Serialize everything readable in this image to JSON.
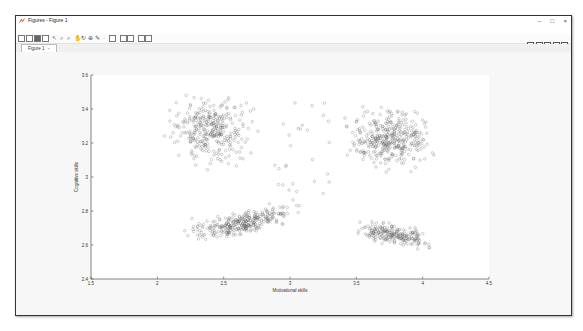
{
  "window": {
    "title": "Figures - Figure 1",
    "controls": {
      "minimize": "–",
      "maximize": "□",
      "close": "×"
    }
  },
  "menubar": {
    "items": [
      "File",
      "Edit",
      "View",
      "Insert",
      "Tools",
      "Debug",
      "Desktop",
      "Window",
      "Help"
    ]
  },
  "toolbar": {
    "buttons": [
      "new-figure",
      "open",
      "save",
      "print",
      "pointer",
      "zoom-in",
      "zoom-out",
      "pan",
      "rotate",
      "data-cursor",
      "brush",
      "link",
      "colorbar",
      "legend",
      "grid",
      "property-editor"
    ],
    "dock_buttons": [
      "tile",
      "left-right",
      "top-bottom",
      "float",
      "maximize"
    ]
  },
  "tabs": [
    {
      "label": "Figure 1",
      "close": "×"
    }
  ],
  "chart_data": {
    "type": "scatter",
    "title": "",
    "xlabel": "Motivational skills",
    "ylabel": "Cognitive skills",
    "xlim": [
      1.5,
      4.5
    ],
    "ylim": [
      2.4,
      3.6
    ],
    "xticks": [
      1.5,
      2,
      2.5,
      3,
      3.5,
      4,
      4.5
    ],
    "xtick_labels": [
      "1.5",
      "2",
      "2.5",
      "3",
      "3.5",
      "4",
      "4.5"
    ],
    "yticks": [
      2.4,
      2.6,
      2.8,
      3,
      3.2,
      3.4,
      3.6
    ],
    "ytick_labels": [
      "2.4",
      "2.6",
      "2.8",
      "3",
      "3.2",
      "3.4",
      "3.6"
    ],
    "grid": false,
    "legend": "none",
    "marker": "open circle",
    "marker_color": "#555555",
    "series": [
      {
        "name": "cluster-top-left",
        "x_range": [
          2.05,
          2.85
        ],
        "y_range": [
          3.0,
          3.5
        ],
        "center": [
          2.4,
          3.28
        ],
        "approx_points": 700
      },
      {
        "name": "cluster-top-right",
        "x_range": [
          3.35,
          4.15
        ],
        "y_range": [
          3.0,
          3.45
        ],
        "center": [
          3.75,
          3.22
        ],
        "approx_points": 800
      },
      {
        "name": "cluster-bottom-middle",
        "x_range": [
          2.1,
          3.15
        ],
        "y_range": [
          2.6,
          2.95
        ],
        "center": [
          2.65,
          2.75
        ],
        "approx_points": 650
      },
      {
        "name": "cluster-bottom-right",
        "x_range": [
          3.3,
          4.05
        ],
        "y_range": [
          2.55,
          2.82
        ],
        "center": [
          3.8,
          2.63
        ],
        "approx_points": 450
      },
      {
        "name": "sparse-middle",
        "x_range": [
          2.85,
          3.3
        ],
        "y_range": [
          2.85,
          3.45
        ],
        "center": [
          3.05,
          3.15
        ],
        "approx_points": 60
      }
    ]
  }
}
